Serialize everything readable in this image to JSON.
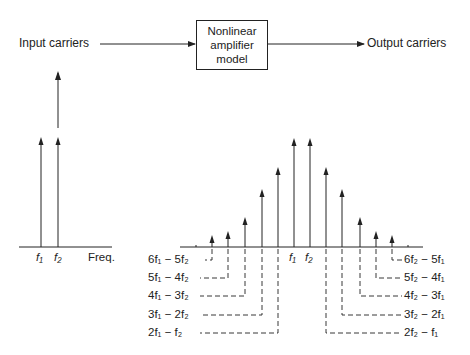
{
  "block_diagram": {
    "input_label": "Input carriers",
    "box_lines": [
      "Nonlinear",
      "amplifier",
      "model"
    ],
    "output_label": "Output carriers"
  },
  "input_spectrum": {
    "carriers": [
      {
        "label": "f1",
        "x": 41,
        "top": 137
      },
      {
        "label": "f2",
        "x": 58,
        "top": 137
      }
    ],
    "f1_label": "f₁",
    "f2_label": "f₂",
    "axis_label": "Freq."
  },
  "output_spectrum": {
    "lines": [
      {
        "x": 212,
        "top": 235,
        "term": "6f1 - 5f2"
      },
      {
        "x": 228,
        "top": 231,
        "term": "5f1 - 4f2"
      },
      {
        "x": 245,
        "top": 217,
        "term": "4f1 - 3f2"
      },
      {
        "x": 262,
        "top": 189,
        "term": "3f1 - 2f2"
      },
      {
        "x": 278,
        "top": 167,
        "term": "2f1 - f2"
      },
      {
        "x": 294,
        "top": 138,
        "term": "f1"
      },
      {
        "x": 310,
        "top": 138,
        "term": "f2"
      },
      {
        "x": 326,
        "top": 167,
        "term": "2f2 - f1"
      },
      {
        "x": 342,
        "top": 189,
        "term": "3f2 - 2f1"
      },
      {
        "x": 360,
        "top": 217,
        "term": "4f2 - 3f1"
      },
      {
        "x": 376,
        "top": 231,
        "term": "5f2 - 4f1"
      },
      {
        "x": 392,
        "top": 235,
        "term": "6f2 - 5f1"
      }
    ],
    "center_f1": "f₁",
    "center_f2": "f₂",
    "left_labels": [
      "6f₁ − 5f₂",
      "5f₁ − 4f₂",
      "4f₁ − 3f₂",
      "3f₁ − 2f₂",
      "2f₁ − f₂"
    ],
    "right_labels": [
      "6f₂ − 5f₁",
      "5f₂ − 4f₁",
      "4f₂ − 3f₁",
      "3f₂ − 2f₁",
      "2f₂ − f₁"
    ]
  }
}
